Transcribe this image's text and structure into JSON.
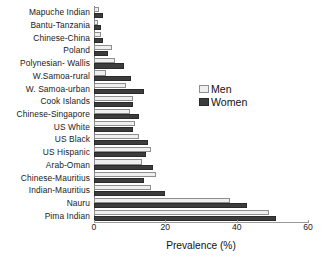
{
  "chart_data": {
    "type": "bar",
    "orientation": "horizontal",
    "title": "",
    "xlabel": "Prevalence (%)",
    "ylabel": "",
    "xlim": [
      0,
      60
    ],
    "xticks": [
      0,
      20,
      40,
      60
    ],
    "grid": false,
    "legend_position": "center-right",
    "categories": [
      "Mapuche Indian",
      "Bantu-Tanzania",
      "Chinese-China",
      "Poland",
      "Polynesian- Wallis",
      "W.Samoa-rural",
      "W. Samoa-urban",
      "Cook Islands",
      "Chinese-Singapore",
      "US White",
      "US Black",
      "US Hispanic",
      "Arab-Oman",
      "Chinese-Mauritius",
      "Indian-Mauritius",
      "Nauru",
      "Pima Indian"
    ],
    "series": [
      {
        "name": "Men",
        "color": "#efefef",
        "values": [
          1.5,
          1.0,
          2.0,
          5.0,
          6.0,
          3.5,
          9.0,
          11.0,
          10.0,
          11.5,
          12.5,
          16.0,
          13.5,
          17.5,
          16.0,
          38.0,
          49.0
        ]
      },
      {
        "name": "Women",
        "color": "#3c3c3c",
        "values": [
          2.5,
          2.0,
          2.5,
          4.0,
          8.5,
          10.5,
          14.0,
          11.0,
          12.5,
          11.0,
          15.0,
          14.5,
          16.5,
          14.0,
          20.0,
          43.0,
          51.0
        ]
      }
    ]
  },
  "legend": {
    "items": [
      {
        "label": "Men",
        "swatch": "men"
      },
      {
        "label": "Women",
        "swatch": "women"
      }
    ]
  }
}
